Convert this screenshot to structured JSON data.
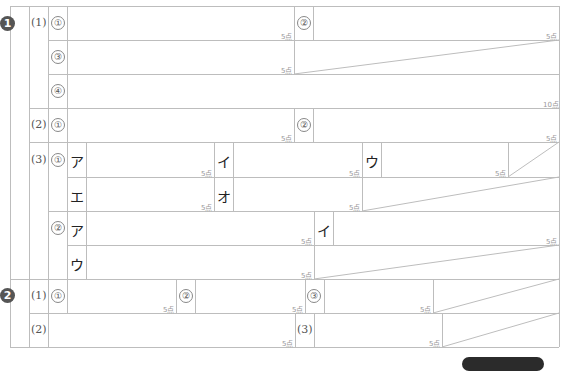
{
  "sections": [
    {
      "badge": "1",
      "questions": [
        {
          "label": "(1)",
          "items": [
            {
              "mark": "①",
              "points": "5点"
            },
            {
              "mark": "②",
              "points": "5点"
            },
            {
              "mark": "③",
              "points": "5点"
            },
            {
              "mark": "④",
              "points": "10点"
            }
          ]
        },
        {
          "label": "(2)",
          "items": [
            {
              "mark": "①",
              "points": "5点"
            },
            {
              "mark": "②",
              "points": "5点"
            }
          ]
        },
        {
          "label": "(3)",
          "items": [
            {
              "mark": "①",
              "subitems": [
                {
                  "kana": "ア",
                  "points": "5点"
                },
                {
                  "kana": "イ",
                  "points": "5点"
                },
                {
                  "kana": "ウ",
                  "points": "5点"
                },
                {
                  "kana": "エ",
                  "points": "5点"
                },
                {
                  "kana": "オ",
                  "points": "5点"
                }
              ]
            },
            {
              "mark": "②",
              "subitems": [
                {
                  "kana": "ア",
                  "points": "5点"
                },
                {
                  "kana": "イ",
                  "points": "5点"
                },
                {
                  "kana": "ウ",
                  "points": "5点"
                }
              ]
            }
          ]
        }
      ]
    },
    {
      "badge": "2",
      "questions": [
        {
          "label": "(1)",
          "items": [
            {
              "mark": "①",
              "points": "5点"
            },
            {
              "mark": "②",
              "points": "5点"
            },
            {
              "mark": "③",
              "points": "5点"
            }
          ]
        },
        {
          "label": "(2)",
          "points": "5点"
        },
        {
          "label": "(3)",
          "points": "5点"
        }
      ]
    }
  ],
  "footer": {
    "tab": ""
  }
}
